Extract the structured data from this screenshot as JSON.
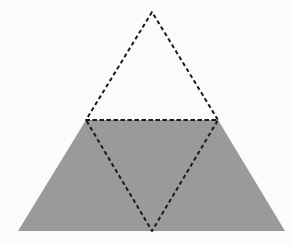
{
  "canvas": {
    "width": 291,
    "height": 244,
    "background": "#fbfbfb"
  },
  "figure": {
    "trapezoid": {
      "points": "86,120 218,120 285,231 18,231",
      "fill": "#9a9a9a"
    },
    "upper_triangle": {
      "points": "152,12 86,120 218,120",
      "stroke": "#1a1a1a",
      "dash": "4,3"
    },
    "inverted_triangle": {
      "points": "86,120 218,120 152,231",
      "stroke": "#1a1a1a",
      "dash": "4,3"
    }
  }
}
